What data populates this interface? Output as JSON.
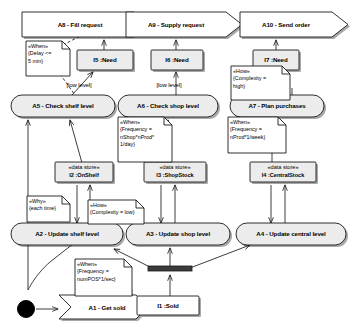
{
  "diagram": {
    "type": "uml-activity-dataflow",
    "colors": {
      "node_fill": "#ececec",
      "store_fill": "#ececec",
      "note_fill": "#ffffff",
      "stroke": "#1a1a1a",
      "shadow": "#9a9a9a",
      "initial_node": "#000000",
      "bar": "#3b3b3b"
    }
  },
  "actions": {
    "a1": "A1 - Get sold",
    "a2": "A2 - Update shelf level",
    "a3": "A3 - Update shop level",
    "a4": "A4 - Update central level",
    "a5": "A5 - Check shelf level",
    "a6": "A6 - Check shop level",
    "a7": "A7 - Plan purchases",
    "a8": "A8 - Fill request",
    "a9": "A9 - Supply request",
    "a10": "A10 - Send order"
  },
  "stores": {
    "i1": {
      "stereotype": "",
      "name": "I1 :Sold"
    },
    "i2": {
      "stereotype": "«data store»",
      "name": "I2 :OnShelf"
    },
    "i3": {
      "stereotype": "«data store»",
      "name": "I3 :ShopStock"
    },
    "i4": {
      "stereotype": "«data store»",
      "name": "I4 :CentralStock"
    },
    "i5": {
      "stereotype": "",
      "name": "I5 :Need"
    },
    "i6": {
      "stereotype": "",
      "name": "I6 :Need"
    },
    "i7": {
      "stereotype": "",
      "name": "I7 :Need"
    }
  },
  "notes": {
    "when_delay": "«When»\n{Delay <=\n5 min}",
    "when_shelf_freq": "«When»\n{Frequency =\nnShop*nProd*\n1/day}",
    "when_central_freq": "«When»\n{Frequency =\nnProd*1/week}",
    "when_sold_freq": "«When»\n{Frequency =\nnumPOS*1/sec}",
    "why_each_time": "«Why»\n{each time}",
    "how_complexity_low": "«How»\n{Complexity = low}",
    "how_complexity_high": "«How»\n{Complexity =\nhigh}"
  },
  "guards": {
    "low_level_shelf": "[low level]",
    "low_level_shop": "[low level]"
  }
}
